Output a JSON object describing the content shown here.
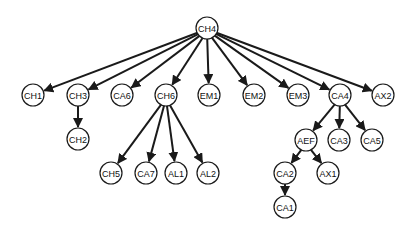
{
  "diagram": {
    "type": "tree",
    "root": "CH4",
    "node_radius": 11,
    "colors": {
      "edge": "#1a1a1a",
      "node_fill": "#ffffff",
      "node_stroke": "#1a1a1a",
      "text": "#111111"
    },
    "nodes": [
      {
        "id": "CH4",
        "label": "CH4",
        "x": 207,
        "y": 28
      },
      {
        "id": "CH1",
        "label": "CH1",
        "x": 33,
        "y": 95
      },
      {
        "id": "CH3",
        "label": "CH3",
        "x": 78,
        "y": 95
      },
      {
        "id": "CA6",
        "label": "CA6",
        "x": 122,
        "y": 95
      },
      {
        "id": "CH6",
        "label": "CH6",
        "x": 166,
        "y": 95
      },
      {
        "id": "EM1",
        "label": "EM1",
        "x": 209,
        "y": 95
      },
      {
        "id": "EM2",
        "label": "EM2",
        "x": 254,
        "y": 95
      },
      {
        "id": "EM3",
        "label": "EM3",
        "x": 298,
        "y": 95
      },
      {
        "id": "CA4",
        "label": "CA4",
        "x": 340,
        "y": 95
      },
      {
        "id": "AX2",
        "label": "AX2",
        "x": 383,
        "y": 95
      },
      {
        "id": "CH2",
        "label": "CH2",
        "x": 78,
        "y": 139
      },
      {
        "id": "CH5",
        "label": "CH5",
        "x": 111,
        "y": 173
      },
      {
        "id": "CA7",
        "label": "CA7",
        "x": 146,
        "y": 173
      },
      {
        "id": "AL1",
        "label": "AL1",
        "x": 176,
        "y": 173
      },
      {
        "id": "AL2",
        "label": "AL2",
        "x": 208,
        "y": 173
      },
      {
        "id": "AEF",
        "label": "AEF",
        "x": 306,
        "y": 140
      },
      {
        "id": "CA3",
        "label": "CA3",
        "x": 339,
        "y": 140
      },
      {
        "id": "CA5",
        "label": "CA5",
        "x": 372,
        "y": 140
      },
      {
        "id": "CA2",
        "label": "CA2",
        "x": 285,
        "y": 173
      },
      {
        "id": "AX1",
        "label": "AX1",
        "x": 328,
        "y": 173
      },
      {
        "id": "CA1",
        "label": "CA1",
        "x": 285,
        "y": 207
      }
    ],
    "edges": [
      {
        "from": "CH4",
        "to": "CH1"
      },
      {
        "from": "CH4",
        "to": "CH3"
      },
      {
        "from": "CH4",
        "to": "CA6"
      },
      {
        "from": "CH4",
        "to": "CH6"
      },
      {
        "from": "CH4",
        "to": "EM1"
      },
      {
        "from": "CH4",
        "to": "EM2"
      },
      {
        "from": "CH4",
        "to": "EM3"
      },
      {
        "from": "CH4",
        "to": "CA4"
      },
      {
        "from": "CH4",
        "to": "AX2"
      },
      {
        "from": "CH3",
        "to": "CH2"
      },
      {
        "from": "CH6",
        "to": "CH5"
      },
      {
        "from": "CH6",
        "to": "CA7"
      },
      {
        "from": "CH6",
        "to": "AL1"
      },
      {
        "from": "CH6",
        "to": "AL2"
      },
      {
        "from": "CA4",
        "to": "AEF"
      },
      {
        "from": "CA4",
        "to": "CA3"
      },
      {
        "from": "CA4",
        "to": "CA5"
      },
      {
        "from": "AEF",
        "to": "CA2"
      },
      {
        "from": "AEF",
        "to": "AX1"
      },
      {
        "from": "CA2",
        "to": "CA1"
      }
    ]
  }
}
